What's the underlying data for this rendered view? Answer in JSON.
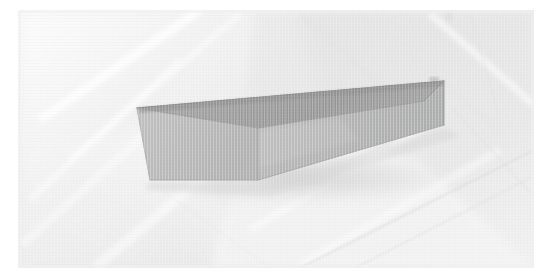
{
  "canvas": {
    "width": 552,
    "height": 280,
    "background_color": "#ffffff",
    "content_description": "photograph of a grey rectangular block resting on a pale textured cloth surface"
  },
  "photo": {
    "frame": {
      "x": 18,
      "y": 10,
      "width": 516,
      "height": 258
    },
    "background_surface": {
      "name": "pale-textured-cloth",
      "base_color": "#ececed",
      "highlight_color": "#f7f7f7",
      "shadow_color": "#dedede",
      "seam_line_color": "#d8d8d8",
      "creases": [
        {
          "name": "crease-upper-left-diagonal",
          "tone": "#f6f6f6"
        },
        {
          "name": "crease-upper-right-band",
          "tone": "#e2e2e3"
        },
        {
          "name": "crease-lower-left-fold",
          "tone": "#f5f5f5"
        },
        {
          "name": "crease-center-wedge",
          "tone": "#e6e6e7"
        },
        {
          "name": "seam-lower-right-long",
          "tone": "#d9d9da"
        },
        {
          "name": "seam-right-vertical",
          "tone": "#dcdcdd"
        }
      ]
    },
    "object": {
      "name": "grey-rectangular-block",
      "shape": "cuboid",
      "orientation": "long axis receding to upper-right",
      "faces": [
        {
          "name": "top-face",
          "color": "#9a9a9a",
          "relative_brightness": "darkest"
        },
        {
          "name": "front-long-face",
          "color": "#b4b4b4",
          "relative_brightness": "mid"
        },
        {
          "name": "left-end-face",
          "color": "#b9b9b9",
          "relative_brightness": "lightest"
        }
      ],
      "vertices": {
        "top_back_left": [
          137,
          108
        ],
        "top_back_right": [
          444,
          81
        ],
        "top_front_right": [
          424,
          101
        ],
        "top_front_left": [
          258,
          128
        ],
        "bottom_right": [
          444,
          125
        ],
        "bottom_front_left": [
          258,
          180
        ],
        "bottom_left": [
          150,
          180
        ]
      },
      "edge_color": "#8d8d8d",
      "cast_shadow": {
        "name": "block-cast-shadow",
        "color": "#dadada",
        "direction": "lower-left"
      }
    }
  }
}
